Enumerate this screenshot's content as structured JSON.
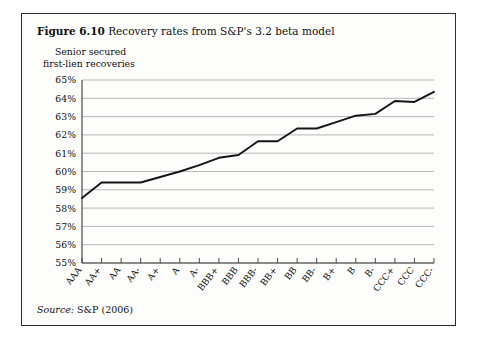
{
  "figure": {
    "number": "Figure 6.10",
    "caption": "Recovery rates from S&P's 3.2 beta model",
    "axis_title_line1": "Senior secured",
    "axis_title_line2": "first-lien recoveries",
    "source_label": "Source:",
    "source_text": "S&P (2006)"
  },
  "colors": {
    "frame": "#2b2b2b",
    "background": "#fdfdfb",
    "gridline": "#9a9a9a",
    "axis": "#3a3a3a",
    "series_line": "#151515",
    "text": "#111111"
  },
  "chart_data": {
    "type": "line",
    "title": "Recovery rates from S&P's 3.2 beta model",
    "xlabel": "",
    "ylabel": "Senior secured first-lien recoveries",
    "ylim": [
      55,
      65
    ],
    "ytick_labels": [
      "65%",
      "64%",
      "63%",
      "62%",
      "61%",
      "60%",
      "59%",
      "58%",
      "57%",
      "56%",
      "55%"
    ],
    "ytick_values": [
      65,
      64,
      63,
      62,
      61,
      60,
      59,
      58,
      57,
      56,
      55
    ],
    "grid": true,
    "legend": "none",
    "categories": [
      "AAA",
      "AA+",
      "AA",
      "AA-",
      "A+",
      "A",
      "A-",
      "BBB+",
      "BBB",
      "BBB-",
      "BB+",
      "BB",
      "BB-",
      "B+",
      "B",
      "B-",
      "CCC+",
      "CCC",
      "CCC-"
    ],
    "values": [
      58.55,
      59.4,
      59.4,
      59.4,
      59.7,
      60.0,
      60.35,
      60.75,
      60.9,
      61.65,
      61.65,
      62.35,
      62.35,
      62.7,
      63.05,
      63.15,
      63.85,
      63.8,
      64.35
    ],
    "series": [
      {
        "name": "Senior secured first-lien recoveries",
        "values": [
          58.55,
          59.4,
          59.4,
          59.4,
          59.7,
          60.0,
          60.35,
          60.75,
          60.9,
          61.65,
          61.65,
          62.35,
          62.35,
          62.7,
          63.05,
          63.15,
          63.85,
          63.8,
          64.35
        ]
      }
    ]
  }
}
